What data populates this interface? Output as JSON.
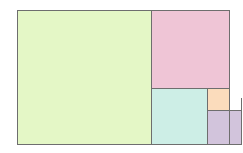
{
  "diagram": {
    "stroke_color": "#6e6e6e",
    "squares": [
      {
        "name": "square-1",
        "side": 131,
        "color": "#e4f7c6"
      },
      {
        "name": "square-2",
        "side": 81,
        "color": "#efc5d6"
      },
      {
        "name": "square-3",
        "side": 50,
        "color": "#cdeee6"
      },
      {
        "name": "square-4",
        "side": 31,
        "color": "#fbdcbc"
      },
      {
        "name": "square-5",
        "side": 19,
        "color": "#d2c4dc"
      },
      {
        "name": "square-6",
        "side": 12,
        "color": "#d6efc6"
      },
      {
        "name": "square-7",
        "side": 7,
        "color": "#f3c4d1"
      },
      {
        "name": "square-8",
        "side": 5,
        "color": "#cdeee6"
      },
      {
        "name": "square-9",
        "side": 2,
        "color": "#fbdcbc"
      }
    ]
  }
}
